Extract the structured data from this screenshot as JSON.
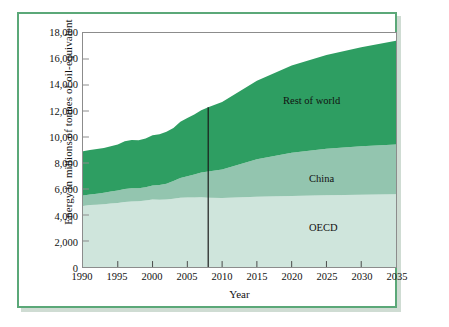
{
  "figure": {
    "border_color": "#5ba878",
    "background": "#ffffff"
  },
  "axis_titles": {
    "y": "Energy in millions of tonnes of oil-equivalent",
    "x": "Year"
  },
  "annotations": [
    {
      "name": "rest-of-world",
      "label": "Rest of world"
    },
    {
      "name": "china",
      "label": "China"
    },
    {
      "name": "oecd",
      "label": "OECD"
    }
  ],
  "chart_data": {
    "type": "area",
    "stacked": true,
    "title": "",
    "xlabel": "Year",
    "ylabel": "Energy in millions of tonnes of oil-equivalent",
    "xlim": [
      1990,
      2035
    ],
    "ylim": [
      0,
      18000
    ],
    "xticks": [
      1990,
      1995,
      2000,
      2005,
      2010,
      2015,
      2020,
      2025,
      2030,
      2035
    ],
    "xtick_labels": [
      "1990",
      "1995",
      "2000",
      "2005",
      "2010",
      "2015",
      "2020",
      "2025",
      "2030",
      "2035"
    ],
    "yticks": [
      0,
      2000,
      4000,
      6000,
      8000,
      10000,
      12000,
      14000,
      16000,
      18000
    ],
    "ytick_labels": [
      "0",
      "2,000",
      "4,000",
      "6,000",
      "8,000",
      "10,000",
      "12,000",
      "14,000",
      "16,000",
      "18,000"
    ],
    "grid": false,
    "legend": "in-plot-annotations",
    "colors": {
      "oecd": "#cfe5dc",
      "china": "#93c5af",
      "rest_of_world": "#2e9e62",
      "divider": "#1a1a1a",
      "frame": "#8c8c8c"
    },
    "divider": {
      "x": 2008,
      "label": ""
    },
    "x": [
      1990,
      1991,
      1992,
      1993,
      1994,
      1995,
      1996,
      1997,
      1998,
      1999,
      2000,
      2001,
      2002,
      2003,
      2004,
      2005,
      2006,
      2007,
      2008,
      2010,
      2015,
      2020,
      2025,
      2030,
      2035
    ],
    "series": [
      {
        "name": "OECD",
        "values": [
          4700,
          4760,
          4790,
          4830,
          4880,
          4930,
          5000,
          5040,
          5060,
          5110,
          5190,
          5180,
          5200,
          5250,
          5330,
          5350,
          5350,
          5370,
          5330,
          5300,
          5400,
          5470,
          5520,
          5560,
          5600
        ]
      },
      {
        "name": "China",
        "values": [
          800,
          820,
          850,
          890,
          930,
          960,
          1000,
          1010,
          1000,
          1020,
          1070,
          1120,
          1210,
          1360,
          1520,
          1640,
          1760,
          1900,
          2010,
          2200,
          2880,
          3320,
          3570,
          3720,
          3820
        ]
      },
      {
        "name": "Rest of world",
        "values": [
          3400,
          3420,
          3430,
          3430,
          3470,
          3540,
          3680,
          3720,
          3690,
          3760,
          3870,
          3910,
          3990,
          4090,
          4320,
          4480,
          4630,
          4780,
          4950,
          5200,
          6040,
          6710,
          7210,
          7630,
          7990
        ]
      }
    ],
    "totals": [
      8900,
      9000,
      9070,
      9150,
      9280,
      9430,
      9680,
      9770,
      9750,
      9890,
      10130,
      10210,
      10400,
      10700,
      11170,
      11470,
      11740,
      12050,
      12290,
      12700,
      14320,
      15500,
      16300,
      16910,
      17410
    ]
  }
}
